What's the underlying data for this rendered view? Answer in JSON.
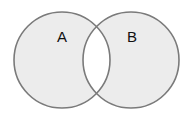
{
  "diagram": {
    "type": "venn",
    "shading": "symmetric-difference",
    "sets": [
      {
        "label": "A",
        "cx": 62,
        "cy": 60,
        "r": 48
      },
      {
        "label": "B",
        "cx": 131,
        "cy": 60,
        "r": 48
      }
    ],
    "colors": {
      "fill": "#ececec",
      "intersection": "#ffffff",
      "stroke": "#7a7a7a"
    }
  }
}
